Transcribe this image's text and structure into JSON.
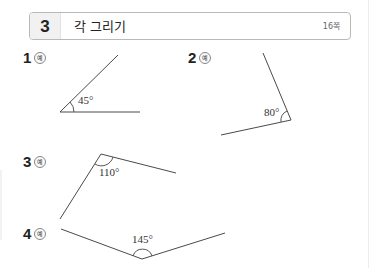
{
  "header": {
    "section_number": "3",
    "title": "각 그리기",
    "page_ref": "16쪽"
  },
  "problems": [
    {
      "number": "1",
      "example_label": "예",
      "angle": "45°"
    },
    {
      "number": "2",
      "example_label": "예",
      "angle": "80°"
    },
    {
      "number": "3",
      "example_label": "예",
      "angle": "110°"
    },
    {
      "number": "4",
      "example_label": "예",
      "angle": "145°"
    }
  ],
  "colors": {
    "line": "#4a4a4a",
    "header_border": "#b9b9b9",
    "header_num_bg": "#f1f1f1"
  }
}
